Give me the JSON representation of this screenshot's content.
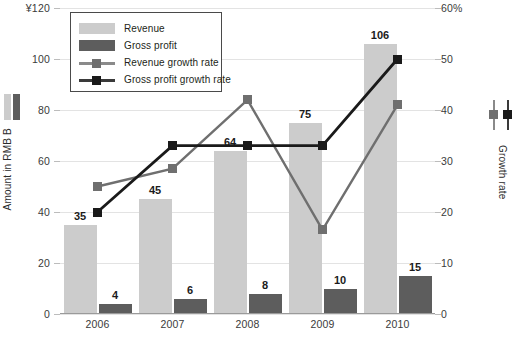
{
  "chart_data": {
    "type": "bar",
    "title": "",
    "categories": [
      "2006",
      "2007",
      "2008",
      "2009",
      "2010"
    ],
    "ylabel": "Amount in RMB B",
    "y2label": "Growth rate",
    "xlabel": "",
    "ylim": [
      0,
      120
    ],
    "y2lim": [
      0,
      60
    ],
    "yticks": [
      "0",
      "20",
      "40",
      "60",
      "80",
      "100",
      "¥120"
    ],
    "y2ticks": [
      "0",
      "10",
      "20",
      "30",
      "40",
      "50",
      "60%"
    ],
    "grid": true,
    "legend_position": "top-left",
    "series": [
      {
        "name": "Revenue",
        "type": "bar",
        "axis": "left",
        "color": "#cccccc",
        "values": [
          35,
          45,
          64,
          75,
          106
        ],
        "labels": [
          "35",
          "45",
          "64",
          "75",
          "106"
        ]
      },
      {
        "name": "Gross profit",
        "type": "bar",
        "axis": "left",
        "color": "#5d5d5d",
        "values": [
          4,
          6,
          8,
          10,
          15
        ],
        "labels": [
          "4",
          "6",
          "8",
          "10",
          "15"
        ]
      },
      {
        "name": "Revenue growth rate",
        "type": "line",
        "axis": "right",
        "color": "#6f6f6f",
        "values": [
          25,
          28.5,
          42,
          16.5,
          41
        ]
      },
      {
        "name": "Gross profit growth rate",
        "type": "line",
        "axis": "right",
        "color": "#1a1a1a",
        "values": [
          20,
          33,
          33,
          33,
          50
        ]
      }
    ]
  },
  "legend": {
    "items": [
      {
        "label": "Revenue",
        "key": "rev-bar"
      },
      {
        "label": "Gross profit",
        "key": "gp-bar"
      },
      {
        "label": "Revenue growth rate",
        "key": "rev-line"
      },
      {
        "label": "Gross profit growth rate",
        "key": "gp-line"
      }
    ]
  },
  "colors": {
    "revenue_bar": "#cccccc",
    "gross_profit_bar": "#5d5d5d",
    "revenue_line": "#6f6f6f",
    "gross_profit_line": "#1a1a1a",
    "grid": "#e3e3e3",
    "text": "#231f20"
  }
}
